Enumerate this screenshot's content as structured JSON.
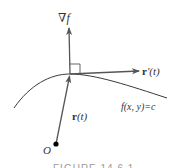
{
  "diagram": {
    "type": "gradient-orthogonal-to-level-curve",
    "colors": {
      "curve": "#3a3a3a",
      "vector": "#555555",
      "text": "#333333",
      "point": "#000000"
    },
    "labels": {
      "gradient_nabla": "∇",
      "gradient_f": "f",
      "tangent_r": "r",
      "tangent_suffix": "′(t)",
      "position_r": "r",
      "position_suffix": "(t)",
      "level_curve_f": "f",
      "level_curve_rest": "(x, y)=c",
      "origin": "O"
    },
    "caption": "FIGURE 14.6.1"
  }
}
